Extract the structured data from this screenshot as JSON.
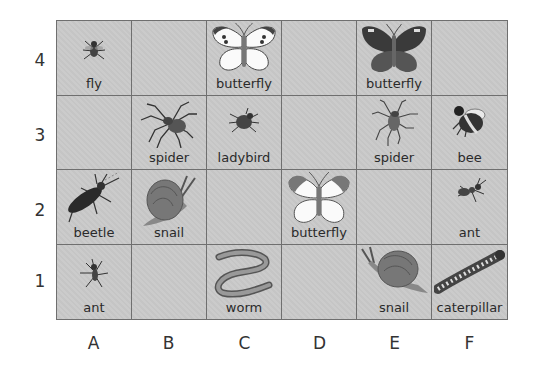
{
  "row_labels": [
    "4",
    "3",
    "2",
    "1"
  ],
  "col_labels": [
    "A",
    "B",
    "C",
    "D",
    "E",
    "F"
  ],
  "grid": [
    [
      {
        "col": "A",
        "row": "4",
        "label": "fly",
        "icon": "fly-icon"
      },
      {
        "col": "B",
        "row": "4",
        "label": "",
        "icon": ""
      },
      {
        "col": "C",
        "row": "4",
        "label": "butterfly",
        "icon": "white-butterfly-icon"
      },
      {
        "col": "D",
        "row": "4",
        "label": "",
        "icon": ""
      },
      {
        "col": "E",
        "row": "4",
        "label": "butterfly",
        "icon": "dark-butterfly-icon"
      },
      {
        "col": "F",
        "row": "4",
        "label": "",
        "icon": ""
      }
    ],
    [
      {
        "col": "A",
        "row": "3",
        "label": "",
        "icon": ""
      },
      {
        "col": "B",
        "row": "3",
        "label": "spider",
        "icon": "spider-icon"
      },
      {
        "col": "C",
        "row": "3",
        "label": "ladybird",
        "icon": "ladybird-icon"
      },
      {
        "col": "D",
        "row": "3",
        "label": "",
        "icon": ""
      },
      {
        "col": "E",
        "row": "3",
        "label": "spider",
        "icon": "spider-icon"
      },
      {
        "col": "F",
        "row": "3",
        "label": "bee",
        "icon": "bee-icon"
      }
    ],
    [
      {
        "col": "A",
        "row": "2",
        "label": "beetle",
        "icon": "beetle-icon"
      },
      {
        "col": "B",
        "row": "2",
        "label": "snail",
        "icon": "snail-icon"
      },
      {
        "col": "C",
        "row": "2",
        "label": "",
        "icon": ""
      },
      {
        "col": "D",
        "row": "2",
        "label": "butterfly",
        "icon": "orange-tip-butterfly-icon"
      },
      {
        "col": "E",
        "row": "2",
        "label": "",
        "icon": ""
      },
      {
        "col": "F",
        "row": "2",
        "label": "ant",
        "icon": "ant-icon"
      }
    ],
    [
      {
        "col": "A",
        "row": "1",
        "label": "ant",
        "icon": "ant-icon"
      },
      {
        "col": "B",
        "row": "1",
        "label": "",
        "icon": ""
      },
      {
        "col": "C",
        "row": "1",
        "label": "worm",
        "icon": "worm-icon"
      },
      {
        "col": "D",
        "row": "1",
        "label": "",
        "icon": ""
      },
      {
        "col": "E",
        "row": "1",
        "label": "snail",
        "icon": "snail-icon"
      },
      {
        "col": "F",
        "row": "1",
        "label": "caterpillar",
        "icon": "caterpillar-icon"
      }
    ]
  ]
}
